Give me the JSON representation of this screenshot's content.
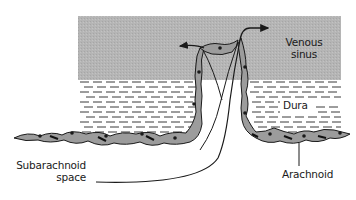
{
  "diagram": {
    "colors": {
      "sinus_fill": "#b3b3b3",
      "cell_fill": "#9a9a9a",
      "outline": "#1a1a1a",
      "dura_dash": "#3a3a3a",
      "background": "#ffffff"
    },
    "labels": {
      "venous_sinus_line1": "Venous",
      "venous_sinus_line2": "sinus",
      "dura": "Dura",
      "subarachnoid_line1": "Subarachnoid",
      "subarachnoid_line2": "space",
      "arachnoid": "Arachnoid"
    },
    "regions": [
      {
        "name": "Venous sinus",
        "style": "gray stippled fill"
      },
      {
        "name": "Dura",
        "style": "horizontal dashed lines"
      },
      {
        "name": "Arachnoid",
        "style": "chain of spindle-shaped cells with dark nuclei"
      },
      {
        "name": "Subarachnoid space",
        "style": "white region below arachnoid, extending up into villus"
      }
    ],
    "arrows": [
      {
        "from": "villus tip",
        "to": "venous sinus (left)",
        "meaning": "CSF flow into sinus"
      },
      {
        "from": "villus tip",
        "to": "venous sinus (right)",
        "meaning": "CSF flow into sinus"
      }
    ]
  }
}
